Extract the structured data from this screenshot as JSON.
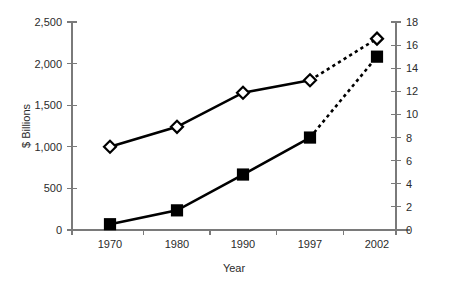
{
  "chart_data": {
    "type": "line",
    "title": "",
    "xlabel": "Year",
    "ylabel": "$ Billions",
    "y2label": "",
    "categories": [
      "1970",
      "1980",
      "1990",
      "1997",
      "2002"
    ],
    "x_tick_labels": [
      "1970",
      "1980",
      "1990",
      "1997",
      "2002"
    ],
    "y_tick_labels": [
      "0",
      "500",
      "1,000",
      "1,500",
      "2,000",
      "2,500"
    ],
    "y_tick_values": [
      0,
      500,
      1000,
      1500,
      2000,
      2500
    ],
    "y2_tick_labels": [
      "0",
      "2",
      "4",
      "6",
      "8",
      "10",
      "12",
      "14",
      "16",
      "18"
    ],
    "y2_tick_values": [
      0,
      2,
      4,
      6,
      8,
      10,
      12,
      14,
      16,
      18
    ],
    "ylim": [
      0,
      2500
    ],
    "y2lim": [
      0,
      18
    ],
    "grid": false,
    "legend": "none",
    "series": [
      {
        "name": "diamond-series",
        "axis": "left",
        "marker": "diamond-open",
        "values": [
          1000,
          1240,
          1650,
          1800,
          2300
        ],
        "solid_through_index": 3,
        "dashed_tail": true
      },
      {
        "name": "square-series",
        "axis": "right",
        "marker": "square-filled",
        "values": [
          0.5,
          1.7,
          4.8,
          8.0,
          15.0
        ],
        "solid_through_index": 3,
        "dashed_tail": true
      }
    ]
  },
  "colors": {
    "series": "#000000",
    "axis": "#7a7a7a",
    "text": "#2b2b2b",
    "background": "#ffffff"
  }
}
